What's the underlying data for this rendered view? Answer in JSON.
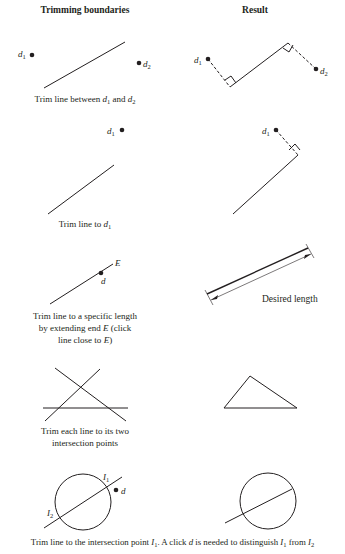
{
  "headers": {
    "left": "Trimming boundaries",
    "right": "Result"
  },
  "rows": [
    {
      "caption_parts": [
        "Trim line between ",
        "d",
        "1",
        " and ",
        "d",
        "2"
      ],
      "labels": {
        "d1": "d",
        "d1_sub": "1",
        "d2": "d",
        "d2_sub": "2",
        "r_d1": "d",
        "r_d1_sub": "1",
        "r_d2": "d",
        "r_d2_sub": "2"
      }
    },
    {
      "caption_parts": [
        "Trim line to ",
        "d",
        "1"
      ],
      "labels": {
        "d1": "d",
        "d1_sub": "1",
        "r_d1": "d",
        "r_d1_sub": "1"
      }
    },
    {
      "caption_lines": [
        "Trim line to a specific length",
        "by extending end ",
        "E",
        " (click",
        "line close to ",
        "E",
        ")"
      ],
      "labels": {
        "E": "E",
        "d": "d",
        "desired": "Desired length"
      }
    },
    {
      "caption_lines": [
        "Trim each line to its two",
        "intersection points"
      ]
    },
    {
      "caption_parts": [
        "Trim line to the intersection point ",
        "I",
        "1",
        ". A click ",
        "d",
        " is needed to distinguish ",
        "I",
        "1",
        " from ",
        "I",
        "2"
      ],
      "labels": {
        "I1": "I",
        "I1_sub": "1",
        "I2": "I",
        "I2_sub": "2",
        "d": "d"
      }
    }
  ]
}
